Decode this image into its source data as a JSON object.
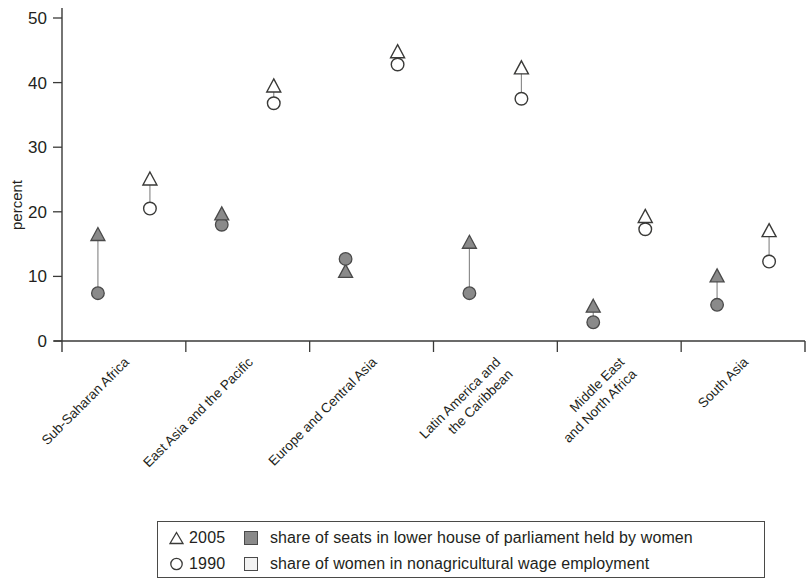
{
  "chart_data": {
    "type": "scatter",
    "title": "",
    "xlabel": "",
    "ylabel": "percent",
    "ylim": [
      0,
      50
    ],
    "yticks": [
      0,
      10,
      20,
      30,
      40,
      50
    ],
    "grid": false,
    "legend_position": "bottom",
    "categories": [
      "Sub-Saharan Africa",
      "East Asia and the Pacific",
      "Europe and Central Asia",
      "Latin America and\nthe Caribbean",
      "Middle East\nand North Africa",
      "South Asia"
    ],
    "category_lines": [
      [
        "Sub-Saharan Africa"
      ],
      [
        "East Asia and the Pacific"
      ],
      [
        "Europe and Central Asia"
      ],
      [
        "Latin America and",
        "the Caribbean"
      ],
      [
        "Middle East",
        "and North Africa"
      ],
      [
        "South Asia"
      ]
    ],
    "series": [
      {
        "name": "share of seats in lower house of parliament held by women, 2005",
        "marker": "filled-triangle",
        "year": "2005",
        "indicator": "parliament",
        "values": [
          16.4,
          19.6,
          10.7,
          15.2,
          5.3,
          10.0
        ]
      },
      {
        "name": "share of seats in lower house of parliament held by women, 1990",
        "marker": "filled-circle",
        "year": "1990",
        "indicator": "parliament",
        "values": [
          7.4,
          18.0,
          12.7,
          7.4,
          2.9,
          5.6
        ]
      },
      {
        "name": "share of women in nonagricultural wage employment, 2005",
        "marker": "open-triangle",
        "year": "2005",
        "indicator": "wage-employment",
        "values": [
          25.0,
          39.4,
          44.7,
          42.2,
          19.2,
          17.0
        ]
      },
      {
        "name": "share of women in nonagricultural wage employment, 1990",
        "marker": "open-circle",
        "year": "1990",
        "indicator": "wage-employment",
        "values": [
          20.5,
          36.8,
          42.8,
          37.5,
          17.3,
          12.3
        ]
      }
    ]
  },
  "legend": {
    "rows": [
      {
        "year": "2005",
        "symbol": "open-triangle",
        "swatch": "dark",
        "text": "share of seats in lower house of parliament held by women"
      },
      {
        "year": "1990",
        "symbol": "open-circle",
        "swatch": "light",
        "text": "share of women in nonagricultural wage employment"
      }
    ]
  },
  "colors": {
    "filled_marker": "#8a8a8a",
    "marker_stroke": "#4a4a4a",
    "axis": "#3a3a38",
    "text": "#231f20",
    "background": "#ffffff"
  }
}
